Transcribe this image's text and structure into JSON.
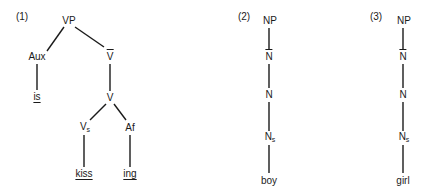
{
  "diagram_type": "syntax-trees",
  "trees": [
    {
      "label": "(1)",
      "nodes": {
        "vp": "VP",
        "aux": "Aux",
        "vbar": "V",
        "is": "is",
        "v": "V",
        "vs": "V",
        "vs_sub": "s",
        "af": "Af",
        "kiss": "kiss",
        "ing": "ing"
      }
    },
    {
      "label": "(2)",
      "nodes": {
        "np": "NP",
        "nbar": "N",
        "n": "N",
        "ns": "N",
        "ns_sub": "s",
        "word": "boy"
      }
    },
    {
      "label": "(3)",
      "nodes": {
        "np": "NP",
        "nbar": "N",
        "n": "N",
        "ns": "N",
        "ns_sub": "s",
        "word": "girl"
      }
    }
  ],
  "colors": {
    "ink": "#1a1a1a",
    "background": "#ffffff"
  }
}
